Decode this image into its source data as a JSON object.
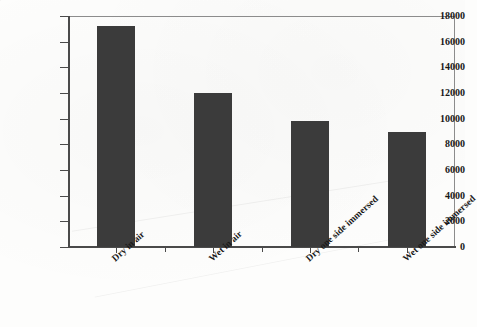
{
  "chart_data": {
    "type": "bar",
    "title": "",
    "xlabel": "",
    "ylabel": "Avg no of cycles to failure",
    "categories": [
      "Dry in air",
      "Wet in air",
      "Dry one side immersed",
      "Wet one side immersed"
    ],
    "values": [
      17200,
      12000,
      9800,
      9000
    ],
    "ylim": [
      0,
      18000
    ],
    "yticks": [
      0,
      2000,
      4000,
      6000,
      8000,
      10000,
      12000,
      14000,
      16000,
      18000
    ],
    "ytick_labels": [
      "0",
      "2000",
      "4000",
      "6000",
      "8000",
      "10000",
      "12000",
      "14000",
      "16000",
      "18000"
    ],
    "grid": false,
    "legend": null,
    "bar_color": "#3b3b3b",
    "axis_color": "#4a4a4a",
    "background_color": "#fdfdfc"
  }
}
